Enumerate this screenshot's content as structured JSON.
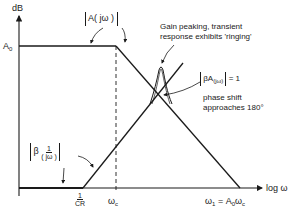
{
  "diagram": {
    "type": "bode-magnitude-plot",
    "axes": {
      "y_label": "dB",
      "x_label": "log ω",
      "y_level_label": "A",
      "y_level_sub": "0"
    },
    "x_ticks": {
      "one_over_cr_num": "1",
      "one_over_cr_den": "CR",
      "omega_c": "ω",
      "omega_c_sub": "c",
      "omega_1": "ω",
      "omega_1_sub": "1",
      "omega_1_eq": " = A",
      "omega_1_eq_sub": "0",
      "omega_1_tail": "ω",
      "omega_1_tail_sub": "c"
    },
    "curves": {
      "open_loop_label": "A( jω )",
      "feedback_label_beta": "β",
      "feedback_label_num": "1",
      "feedback_label_den": "( jω )"
    },
    "annotations": {
      "peaking_line1": "Gain peaking, transient",
      "peaking_line2": "response exhibits 'ringing'",
      "loop_gain_beta": "βA",
      "loop_gain_sub": "(jω)",
      "loop_gain_eq": " = 1",
      "phase_line1": "phase shift",
      "phase_line2": "approaches 180°"
    },
    "colors": {
      "ink": "#1a1a1a",
      "background": "#ffffff"
    }
  }
}
